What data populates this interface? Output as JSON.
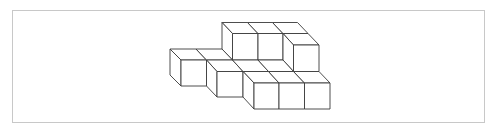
{
  "figure": {
    "type": "isometric-cube-arrangement",
    "cube_count": 11,
    "colors": {
      "line": "#3a3a3a",
      "fill": "#ffffff",
      "border": "#c8c8c8"
    }
  }
}
